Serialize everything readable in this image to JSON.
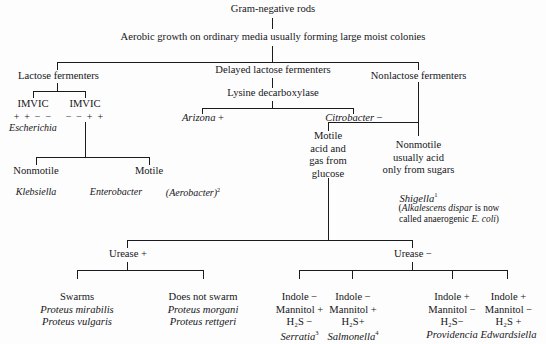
{
  "diagram": {
    "root": "Gram-negative rods",
    "level1": "Aerobic growth on ordinary media usually forming large moist colonies",
    "branches": {
      "lactose": "Lactose fermenters",
      "delayed": "Delayed lactose fermenters",
      "nonlactose": "Nonlactose fermenters"
    },
    "lactose_branch": {
      "imvic_left_label": "IMVIC",
      "imvic_left_signs": "+ +  − −",
      "imvic_left_genus": "Escherichia",
      "imvic_right_label": "IMVIC",
      "imvic_right_signs": "− − + +",
      "nonmotile": "Nonmotile",
      "motile": "Motile",
      "nonmotile_genus": "Klebsiella",
      "motile_genus": "Enterobacter",
      "motile_synonym": "(Aerobacter)",
      "motile_synonym_sup": "2"
    },
    "delayed_branch": {
      "test": "Lysine decarboxylase",
      "positive_genus": "Arizona",
      "positive_sign": "+",
      "negative_genus": "Citrobacter",
      "negative_sign": "−"
    },
    "nonlactose_branch": {
      "motile_line1": "Motile",
      "motile_line2": "acid and",
      "motile_line3": "gas from",
      "motile_line4": "glucose",
      "nonmotile_line1": "Nonmotile",
      "nonmotile_line2": "usually acid",
      "nonmotile_line3": "only from sugars",
      "shigella": "Shigella",
      "shigella_sup": "1",
      "shigella_note_line1_italic": "Alkalescens dispar",
      "shigella_note_line1_rest": " is now",
      "shigella_note_line2_pre": "called anaerogenic ",
      "shigella_note_line2_italic": "E. coli",
      "shigella_note_line2_post": ")",
      "shigella_note_open": "("
    },
    "urease": {
      "positive": "Urease  +",
      "negative": "Urease  −"
    },
    "urease_positive_groups": [
      {
        "heading": "Swarms",
        "species": [
          "Proteus mirabilis",
          "Proteus vulgaris"
        ]
      },
      {
        "heading": "Does not swarm",
        "species": [
          "Proteus morgani",
          "Proteus rettgeri"
        ]
      }
    ],
    "urease_negative_groups": [
      {
        "indole": "Indole −",
        "mannitol": "Mannitol +",
        "h2s": "H₂S −",
        "genus": "Serratia",
        "genus_sup": "3"
      },
      {
        "indole": "Indole −",
        "mannitol": "Mannitol +",
        "h2s": "H₂S+",
        "genus": "Salmonella",
        "genus_sup": "4"
      },
      {
        "indole": "Indole  +",
        "mannitol": "Mannitol −",
        "h2s": "H₂S−",
        "genus": "Providencia",
        "genus_sup": ""
      },
      {
        "indole": "Indole  +",
        "mannitol": "Mannitol −",
        "h2s": "H₂S  +",
        "genus": "Edwardsiella",
        "genus_sup": ""
      }
    ],
    "colors": {
      "background": "#fdfdfd",
      "ink": "#16161a",
      "line": "#1b1b1f"
    }
  }
}
